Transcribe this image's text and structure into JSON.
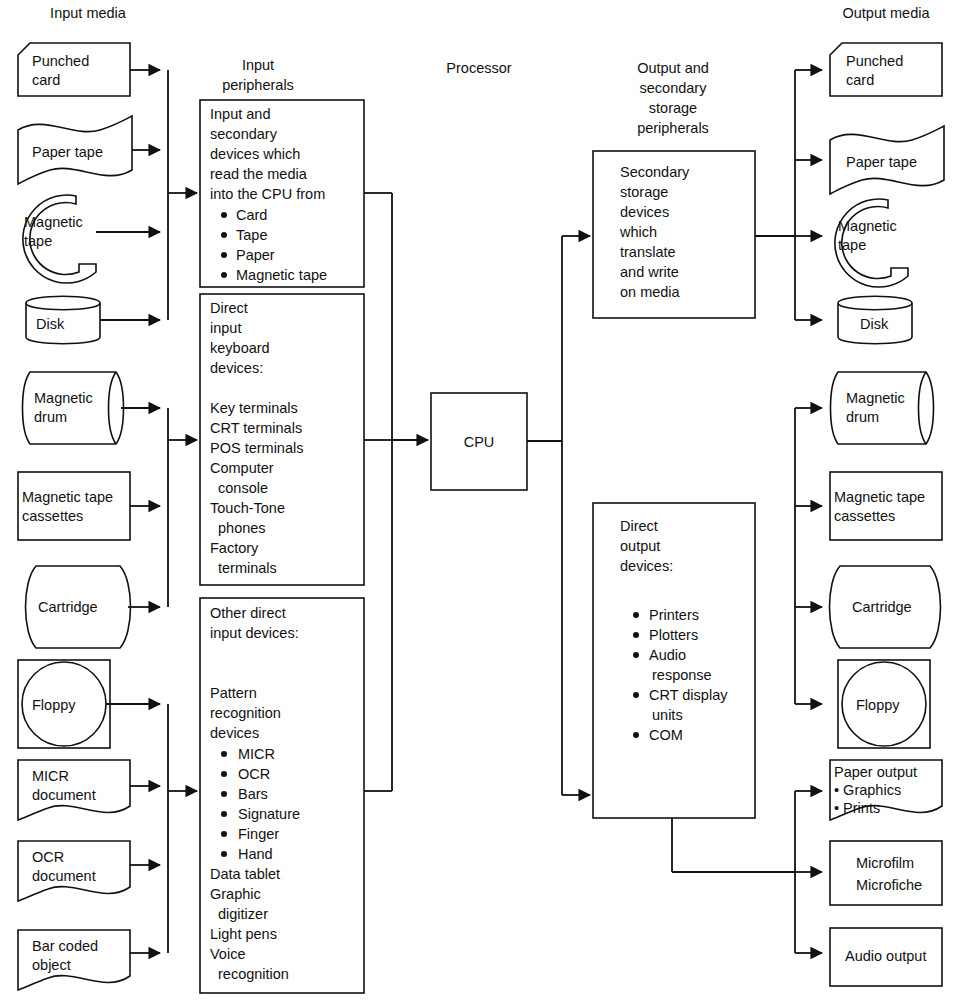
{
  "headers": {
    "input_media": "Input media",
    "input_peripherals_l1": "Input",
    "input_peripherals_l2": "peripherals",
    "processor": "Processor",
    "output_periph_l1": "Output and",
    "output_periph_l2": "secondary",
    "output_periph_l3": "storage",
    "output_periph_l4": "peripherals",
    "output_media": "Output media"
  },
  "input_media": [
    {
      "id": "punched-card",
      "shape": "punched-card",
      "lines": [
        "Punched",
        "card"
      ]
    },
    {
      "id": "paper-tape",
      "shape": "paper-tape",
      "lines": [
        "Paper tape"
      ]
    },
    {
      "id": "magnetic-tape",
      "shape": "magnetic-tape",
      "lines": [
        "Magnetic",
        "tape"
      ]
    },
    {
      "id": "disk",
      "shape": "disk",
      "lines": [
        "Disk"
      ]
    },
    {
      "id": "magnetic-drum",
      "shape": "drum",
      "lines": [
        "Magnetic",
        "drum"
      ]
    },
    {
      "id": "magnetic-tape-cassettes",
      "shape": "rect",
      "lines": [
        "Magnetic tape",
        "cassettes"
      ]
    },
    {
      "id": "cartridge",
      "shape": "cartridge",
      "lines": [
        "Cartridge"
      ]
    },
    {
      "id": "floppy",
      "shape": "floppy",
      "lines": [
        "Floppy"
      ]
    },
    {
      "id": "micr-document",
      "shape": "document",
      "lines": [
        "MICR",
        "document"
      ]
    },
    {
      "id": "ocr-document",
      "shape": "document",
      "lines": [
        "OCR",
        "document"
      ]
    },
    {
      "id": "bar-coded-object",
      "shape": "document",
      "lines": [
        "Bar coded",
        "object"
      ]
    }
  ],
  "input_peripherals": [
    {
      "id": "input-secondary-devices",
      "lines": [
        {
          "text": "Input and",
          "bullet": false,
          "indent": 0
        },
        {
          "text": "secondary",
          "bullet": false,
          "indent": 0
        },
        {
          "text": "devices which",
          "bullet": false,
          "indent": 0
        },
        {
          "text": "read the media",
          "bullet": false,
          "indent": 0
        },
        {
          "text": "into the CPU from",
          "bullet": false,
          "indent": 0
        },
        {
          "text": "Card",
          "bullet": true,
          "indent": 1
        },
        {
          "text": "Tape",
          "bullet": true,
          "indent": 1
        },
        {
          "text": "Paper",
          "bullet": true,
          "indent": 1
        },
        {
          "text": "Magnetic tape",
          "bullet": true,
          "indent": 1
        }
      ]
    },
    {
      "id": "direct-input-keyboard-devices",
      "lines": [
        {
          "text": "Direct",
          "bullet": false,
          "indent": 0
        },
        {
          "text": "input",
          "bullet": false,
          "indent": 0
        },
        {
          "text": "keyboard",
          "bullet": false,
          "indent": 0
        },
        {
          "text": "devices:",
          "bullet": false,
          "indent": 0
        },
        {
          "text": "",
          "bullet": false,
          "indent": 0
        },
        {
          "text": "Key terminals",
          "bullet": false,
          "indent": 0
        },
        {
          "text": "CRT terminals",
          "bullet": false,
          "indent": 0
        },
        {
          "text": "POS terminals",
          "bullet": false,
          "indent": 0
        },
        {
          "text": "Computer",
          "bullet": false,
          "indent": 0
        },
        {
          "text": "console",
          "bullet": false,
          "indent": 1
        },
        {
          "text": "Touch-Tone",
          "bullet": false,
          "indent": 0
        },
        {
          "text": "phones",
          "bullet": false,
          "indent": 1
        },
        {
          "text": "Factory",
          "bullet": false,
          "indent": 0
        },
        {
          "text": "terminals",
          "bullet": false,
          "indent": 1
        }
      ]
    },
    {
      "id": "other-direct-input-devices",
      "lines": [
        {
          "text": "Other direct",
          "bullet": false,
          "indent": 0
        },
        {
          "text": "input devices:",
          "bullet": false,
          "indent": 0
        },
        {
          "text": "",
          "bullet": false,
          "indent": 0
        },
        {
          "text": "",
          "bullet": false,
          "indent": 0
        },
        {
          "text": "Pattern",
          "bullet": false,
          "indent": 0
        },
        {
          "text": "recognition",
          "bullet": false,
          "indent": 0
        },
        {
          "text": "devices",
          "bullet": false,
          "indent": 0
        },
        {
          "text": "MICR",
          "bullet": true,
          "indent": 1
        },
        {
          "text": "OCR",
          "bullet": true,
          "indent": 1
        },
        {
          "text": "Bars",
          "bullet": true,
          "indent": 1
        },
        {
          "text": "Signature",
          "bullet": true,
          "indent": 1
        },
        {
          "text": "Finger",
          "bullet": true,
          "indent": 1
        },
        {
          "text": "Hand",
          "bullet": true,
          "indent": 1
        },
        {
          "text": "Data tablet",
          "bullet": false,
          "indent": 0
        },
        {
          "text": "Graphic",
          "bullet": false,
          "indent": 0
        },
        {
          "text": "digitizer",
          "bullet": false,
          "indent": 1
        },
        {
          "text": "Light pens",
          "bullet": false,
          "indent": 0
        },
        {
          "text": "Voice",
          "bullet": false,
          "indent": 0
        },
        {
          "text": "recognition",
          "bullet": false,
          "indent": 1
        }
      ]
    }
  ],
  "processor": {
    "id": "cpu",
    "label": "CPU"
  },
  "output_peripherals": [
    {
      "id": "secondary-storage-devices",
      "lines": [
        {
          "text": "Secondary",
          "bullet": false,
          "indent": 0
        },
        {
          "text": "storage",
          "bullet": false,
          "indent": 0
        },
        {
          "text": "devices",
          "bullet": false,
          "indent": 0
        },
        {
          "text": "which",
          "bullet": false,
          "indent": 0
        },
        {
          "text": "translate",
          "bullet": false,
          "indent": 0
        },
        {
          "text": "and write",
          "bullet": false,
          "indent": 0
        },
        {
          "text": "on media",
          "bullet": false,
          "indent": 0
        }
      ]
    },
    {
      "id": "direct-output-devices",
      "lines": [
        {
          "text": "Direct",
          "bullet": false,
          "indent": 0
        },
        {
          "text": "output",
          "bullet": false,
          "indent": 0
        },
        {
          "text": "devices:",
          "bullet": false,
          "indent": 0
        },
        {
          "text": "",
          "bullet": false,
          "indent": 0
        },
        {
          "text": "Printers",
          "bullet": true,
          "indent": 1
        },
        {
          "text": "Plotters",
          "bullet": true,
          "indent": 1
        },
        {
          "text": "Audio",
          "bullet": true,
          "indent": 1
        },
        {
          "text": "response",
          "bullet": false,
          "indent": 2
        },
        {
          "text": "CRT display",
          "bullet": true,
          "indent": 1
        },
        {
          "text": "units",
          "bullet": false,
          "indent": 2
        },
        {
          "text": "COM",
          "bullet": true,
          "indent": 1
        }
      ]
    }
  ],
  "output_media": [
    {
      "id": "out-punched-card",
      "shape": "punched-card",
      "lines": [
        "Punched",
        "card"
      ]
    },
    {
      "id": "out-paper-tape",
      "shape": "paper-tape",
      "lines": [
        "Paper tape"
      ]
    },
    {
      "id": "out-magnetic-tape",
      "shape": "magnetic-tape",
      "lines": [
        "Magnetic",
        "tape"
      ]
    },
    {
      "id": "out-disk",
      "shape": "disk",
      "lines": [
        "Disk"
      ]
    },
    {
      "id": "out-magnetic-drum",
      "shape": "drum",
      "lines": [
        "Magnetic",
        "drum"
      ]
    },
    {
      "id": "out-magnetic-tape-cassettes",
      "shape": "rect",
      "lines": [
        "Magnetic tape",
        "cassettes"
      ]
    },
    {
      "id": "out-cartridge",
      "shape": "cartridge",
      "lines": [
        "Cartridge"
      ]
    },
    {
      "id": "out-floppy",
      "shape": "floppy",
      "lines": [
        "Floppy"
      ]
    },
    {
      "id": "out-paper-output",
      "shape": "document",
      "lines": [
        "Paper output",
        "• Graphics",
        "• Prints"
      ]
    },
    {
      "id": "out-microfilm",
      "shape": "rect",
      "lines": [
        "Microfilm",
        "Microfiche"
      ]
    },
    {
      "id": "out-audio-output",
      "shape": "rect",
      "lines": [
        "Audio output"
      ]
    }
  ],
  "colors": {
    "stroke": "#111111",
    "fill": "#ffffff",
    "text": "#111111"
  }
}
